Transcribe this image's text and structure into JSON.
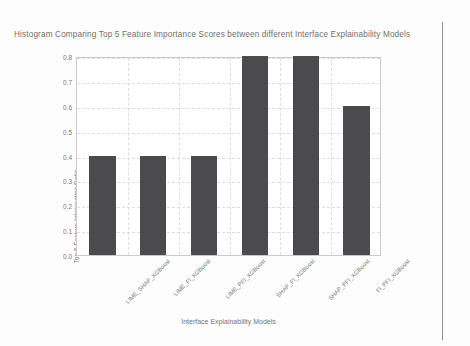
{
  "chart_data": {
    "type": "bar",
    "title": "Histogram Comparing Top 5 Feature Importance Scores between different Interface Explainability Models",
    "xlabel": "Interface Explainability Models",
    "ylabel": "Top 5 Feature Intersection Ratio",
    "categories": [
      "LIME_SHAP_XGBoost",
      "LIME_FI_XGBoost",
      "LIME_PFI_XGBoost",
      "SHAP_FI_XGBoost",
      "SHAP_PFI_XGBoost",
      "FI_PFI_XGBoost"
    ],
    "values": [
      0.4,
      0.4,
      0.4,
      0.8,
      0.8,
      0.6
    ],
    "ylim": [
      0.0,
      0.8
    ],
    "yticks": [
      "0.0",
      "0.1",
      "0.2",
      "0.3",
      "0.4",
      "0.5",
      "0.6",
      "0.7",
      "0.8"
    ],
    "ytick_values": [
      0.0,
      0.1,
      0.2,
      0.3,
      0.4,
      0.5,
      0.6,
      0.7,
      0.8
    ],
    "grid": true,
    "legend": null,
    "bar_color": "#4b4b4d",
    "grid_color": "#dcdce2",
    "axis_color": "#c9c9cf",
    "text_color": "#76767a"
  }
}
